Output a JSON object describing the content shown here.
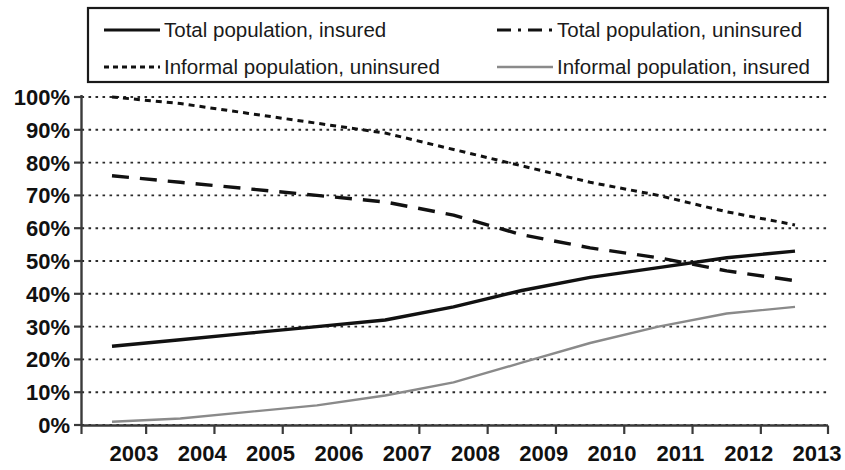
{
  "chart_data": {
    "type": "line",
    "title": "",
    "subtitle": "",
    "xlabel": "",
    "ylabel": "",
    "x": [
      2003,
      2004,
      2005,
      2006,
      2007,
      2008,
      2009,
      2010,
      2011,
      2012,
      2013
    ],
    "categories": [
      "2003",
      "2004",
      "2005",
      "2006",
      "2007",
      "2008",
      "2009",
      "2010",
      "2011",
      "2012",
      "2013"
    ],
    "xlim": [
      2003,
      2013
    ],
    "ylim": [
      0,
      100
    ],
    "y_ticks": [
      0,
      10,
      20,
      30,
      40,
      50,
      60,
      70,
      80,
      90,
      100
    ],
    "y_tick_labels": [
      "0%",
      "10%",
      "20%",
      "30%",
      "40%",
      "50%",
      "60%",
      "70%",
      "80%",
      "90%",
      "100%"
    ],
    "grid": "horizontal-dotted",
    "legend_position": "top",
    "legend_columns": 2,
    "series": [
      {
        "name": "Total population, insured",
        "style": "solid",
        "color": "#111111",
        "width": 3.4,
        "values": [
          24,
          26,
          28,
          30,
          32,
          36,
          41,
          45,
          48,
          51,
          53
        ]
      },
      {
        "name": "Total population, uninsured",
        "style": "dashed",
        "color": "#111111",
        "width": 3.4,
        "values": [
          76,
          74,
          72,
          70,
          68,
          64,
          58,
          54,
          51,
          47,
          44
        ]
      },
      {
        "name": "Informal population, uninsured",
        "style": "dotted",
        "color": "#111111",
        "width": 3.0,
        "values": [
          100,
          98,
          95,
          92,
          89,
          84,
          79,
          74,
          70,
          65,
          61
        ]
      },
      {
        "name": "Informal population, insured",
        "style": "solid",
        "color": "#8a8a8a",
        "width": 2.4,
        "values": [
          1,
          2,
          4,
          6,
          9,
          13,
          19,
          25,
          30,
          34,
          36
        ]
      }
    ]
  },
  "legend": {
    "entries": [
      {
        "label": "Total population, insured",
        "swatch": "solid-black-line-icon"
      },
      {
        "label": "Total population, uninsured",
        "swatch": "dashed-black-line-icon"
      },
      {
        "label": "Informal population, uninsured",
        "swatch": "dotted-black-line-icon"
      },
      {
        "label": "Informal population, insured",
        "swatch": "solid-grey-line-icon"
      }
    ]
  },
  "axes": {
    "y_labels": [
      "100%",
      "90%",
      "80%",
      "70%",
      "60%",
      "50%",
      "40%",
      "30%",
      "20%",
      "10%",
      "0%"
    ],
    "x_labels": [
      "2003",
      "2004",
      "2005",
      "2006",
      "2007",
      "2008",
      "2009",
      "2010",
      "2011",
      "2012",
      "2013"
    ]
  },
  "colors": {
    "background": "#ffffff",
    "axis": "#3a3a3a",
    "grid": "#2b2b2b",
    "series_primary": "#111111",
    "series_grey": "#8a8a8a",
    "legend_border": "#1a1a1a"
  }
}
